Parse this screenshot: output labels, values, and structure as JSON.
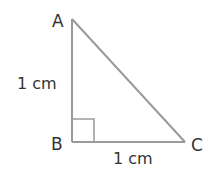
{
  "diagram": {
    "type": "right-triangle",
    "vertices": {
      "A": {
        "label": "A"
      },
      "B": {
        "label": "B"
      },
      "C": {
        "label": "C"
      }
    },
    "sides": {
      "AB": {
        "label": "1 cm"
      },
      "BC": {
        "label": "1 cm"
      }
    },
    "right_angle_at": "B",
    "colors": {
      "line": "#9a9a9a",
      "text": "#333333"
    }
  }
}
